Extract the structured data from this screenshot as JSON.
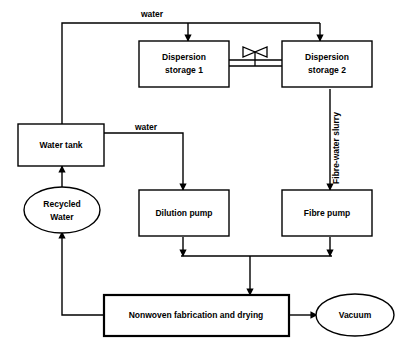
{
  "diagram": {
    "background_color": "#ffffff",
    "line_color": "#000000",
    "nodes": [
      {
        "id": "dispersion-storage-1",
        "shape": "rect",
        "label_line1": "Dispersion",
        "label_line2": "storage 1"
      },
      {
        "id": "dispersion-storage-2",
        "shape": "rect",
        "label_line1": "Dispersion",
        "label_line2": "storage 2"
      },
      {
        "id": "water-tank",
        "shape": "rect",
        "label_line1": "Water tank",
        "label_line2": ""
      },
      {
        "id": "recycled-water",
        "shape": "ellipse",
        "label_line1": "Recycled",
        "label_line2": "Water"
      },
      {
        "id": "dilution-pump",
        "shape": "rect",
        "label_line1": "Dilution pump",
        "label_line2": ""
      },
      {
        "id": "fibre-pump",
        "shape": "rect",
        "label_line1": "Fibre pump",
        "label_line2": ""
      },
      {
        "id": "nonwoven-fabrication-and-drying",
        "shape": "rect",
        "label_line1": "Nonwoven fabrication  and drying",
        "label_line2": ""
      },
      {
        "id": "vacuum",
        "shape": "ellipse",
        "label_line1": "Vacuum",
        "label_line2": ""
      }
    ],
    "edge_labels": {
      "water_top": "water",
      "water_tank_outlet": "water",
      "fibre_water_slurry": "Fibre-water slurry"
    },
    "valve": {
      "name": "butterfly-valve",
      "between": "dispersion-storage-1 to dispersion-storage-2"
    }
  }
}
